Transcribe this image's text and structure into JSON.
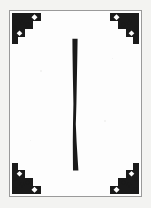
{
  "card": {
    "title": "Decorative framed ornament card",
    "background_color": "#f3f3f1",
    "field_color": "#fefefe",
    "ink_color": "#1a1a1a",
    "border_color": "#9a9a9a",
    "width": 151,
    "height": 208
  },
  "frame": {
    "name": "rectangular rule border",
    "stroke_width": 1,
    "inset_left": 9,
    "inset_top": 10,
    "width": 133,
    "height": 187
  },
  "ornaments": [
    {
      "position": "top-left",
      "shape": "right triangle with notched hypotenuse",
      "cutouts": "white diamonds",
      "accents": "small solid stars",
      "fill": "#1a1a1a"
    },
    {
      "position": "top-right",
      "shape": "right triangle with notched hypotenuse",
      "cutouts": "white diamonds",
      "accents": "small solid stars",
      "fill": "#1a1a1a"
    },
    {
      "position": "bottom-left",
      "shape": "right triangle with notched hypotenuse",
      "cutouts": "white diamonds",
      "accents": "small solid stars",
      "fill": "#1a1a1a"
    },
    {
      "position": "bottom-right",
      "shape": "right triangle with notched hypotenuse",
      "cutouts": "white diamonds",
      "accents": "small solid stars",
      "fill": "#1a1a1a"
    }
  ],
  "center_mark": {
    "name": "tapered vertical stroke",
    "reading": "I",
    "description": "thick at top, narrowing toward lower middle, flaring slightly at the foot",
    "fill": "#1a1a1a",
    "top_width_px": 5,
    "waist_width_px": 2,
    "foot_width_px": 5,
    "length_px": 134
  }
}
